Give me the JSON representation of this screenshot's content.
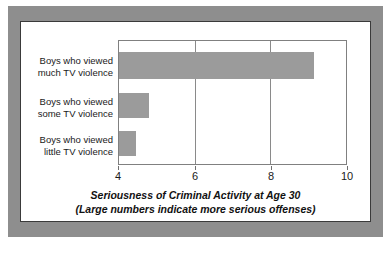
{
  "chart_data": {
    "type": "bar",
    "orientation": "horizontal",
    "title": "",
    "xlabel": "Seriousness of Criminal Activity at Age 30",
    "xlabel_line2": "(Large numbers indicate more serious offenses)",
    "ylabel": "",
    "categories": [
      "Boys who viewed much TV violence",
      "Boys who viewed some TV violence",
      "Boys who viewed little TV violence"
    ],
    "category_lines": [
      [
        "Boys who viewed",
        "much TV violence"
      ],
      [
        "Boys who viewed",
        "some TV violence"
      ],
      [
        "Boys who viewed",
        "little TV violence"
      ]
    ],
    "values": [
      9.15,
      4.8,
      4.45
    ],
    "xlim": [
      4,
      10
    ],
    "xticks": [
      4,
      6,
      8,
      10
    ],
    "xtick_labels": [
      "4",
      "6",
      "8",
      "10"
    ],
    "grid": true,
    "grid_axis": "x",
    "legend": null,
    "bar_color": "#9b9b9b",
    "frame_color": "#8e8e8e",
    "panel_color": "#ffffff",
    "axis_color": "#808080"
  }
}
